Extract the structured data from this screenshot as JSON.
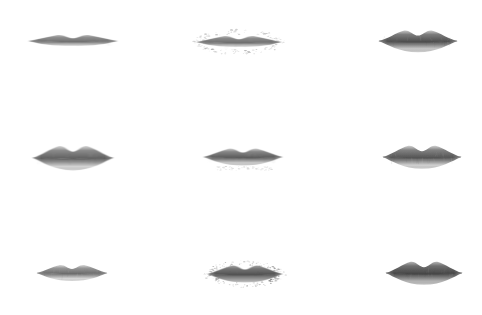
{
  "canvas": {
    "width": 482,
    "height": 315,
    "background": "#ffffff",
    "description": "Grid of nine grayscale lip images on a plain white background"
  },
  "grid": {
    "rows": 3,
    "columns": 3,
    "count": 9
  },
  "items": [
    {
      "id": "lip-r1c1",
      "row": 1,
      "column": 1,
      "label": "lip-image",
      "x": 28,
      "y": 26,
      "width": 90,
      "height": 32,
      "tone": "#8e8e8e",
      "tone_dark": "#6f6f6f",
      "tone_light": "#b9b9b9",
      "fullness": "thin",
      "edge": "soft",
      "speckle": "none",
      "speckle_opacity": 0
    },
    {
      "id": "lip-r1c2",
      "row": 1,
      "column": 2,
      "label": "lip-image",
      "x": 196,
      "y": 27,
      "width": 86,
      "height": 32,
      "tone": "#8b8b8b",
      "tone_dark": "#6c6c6c",
      "tone_light": "#bcbcbc",
      "fullness": "thin",
      "edge": "speckled",
      "speckle": "halo",
      "speckle_opacity": 0.55
    },
    {
      "id": "lip-r1c3",
      "row": 1,
      "column": 3,
      "label": "lip-image",
      "x": 378,
      "y": 25,
      "width": 80,
      "height": 34,
      "tone": "#7c7c7c",
      "tone_dark": "#4d4d4d",
      "tone_light": "#c6c6c6",
      "fullness": "full",
      "edge": "sharp",
      "speckle": "none",
      "speckle_opacity": 0
    },
    {
      "id": "lip-r2c1",
      "row": 2,
      "column": 1,
      "label": "lip-image",
      "x": 32,
      "y": 140,
      "width": 82,
      "height": 38,
      "tone": "#8a8a8a",
      "tone_dark": "#5d5d5d",
      "tone_light": "#d2d2d2",
      "fullness": "full",
      "edge": "soft",
      "speckle": "none",
      "speckle_opacity": 0
    },
    {
      "id": "lip-r2c2",
      "row": 2,
      "column": 2,
      "label": "lip-image",
      "x": 203,
      "y": 141,
      "width": 80,
      "height": 34,
      "tone": "#858585",
      "tone_dark": "#5a5a5a",
      "tone_light": "#cacaca",
      "fullness": "medium",
      "edge": "soft",
      "speckle": "below",
      "speckle_opacity": 0.3
    },
    {
      "id": "lip-r2c3",
      "row": 2,
      "column": 3,
      "label": "lip-image",
      "x": 382,
      "y": 140,
      "width": 80,
      "height": 36,
      "tone": "#828282",
      "tone_dark": "#535353",
      "tone_light": "#cfcfcf",
      "fullness": "full",
      "edge": "sharp",
      "speckle": "none",
      "speckle_opacity": 0
    },
    {
      "id": "lip-r3c1",
      "row": 3,
      "column": 1,
      "label": "lip-image",
      "x": 36,
      "y": 258,
      "width": 72,
      "height": 32,
      "tone": "#969696",
      "tone_dark": "#6a6a6a",
      "tone_light": "#d6d6d6",
      "fullness": "medium",
      "edge": "soft",
      "speckle": "none",
      "speckle_opacity": 0
    },
    {
      "id": "lip-r3c2",
      "row": 3,
      "column": 2,
      "label": "lip-image",
      "x": 207,
      "y": 258,
      "width": 76,
      "height": 34,
      "tone": "#767676",
      "tone_dark": "#4f4f4f",
      "tone_light": "#9e9e9e",
      "fullness": "medium",
      "edge": "speckled",
      "speckle": "halo",
      "speckle_opacity": 0.7
    },
    {
      "id": "lip-r3c3",
      "row": 3,
      "column": 3,
      "label": "lip-image",
      "x": 385,
      "y": 256,
      "width": 78,
      "height": 36,
      "tone": "#6f6f6f",
      "tone_dark": "#454545",
      "tone_light": "#b0b0b0",
      "fullness": "full",
      "edge": "sharp",
      "speckle": "none",
      "speckle_opacity": 0
    }
  ]
}
